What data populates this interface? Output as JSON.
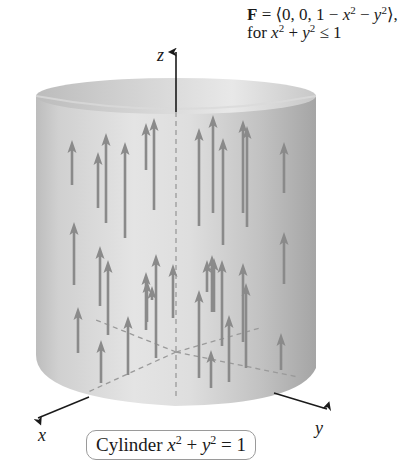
{
  "figure": {
    "title_line1": {
      "F": "F",
      "eq": " = ⟨0, 0, 1 − ",
      "x": "x",
      "x_exp": "2",
      "minus": " − ",
      "y": "y",
      "y_exp": "2",
      "close": "⟩,"
    },
    "title_line2": {
      "for": "for ",
      "x": "x",
      "x_exp": "2",
      "plus": " + ",
      "y": "y",
      "y_exp": "2",
      "rel": " ≤ 1"
    },
    "axes": {
      "z_label": "z",
      "x_label": "x",
      "y_label": "y"
    },
    "cylinder_label": {
      "word": "Cylinder ",
      "x": "x",
      "x_exp": "2",
      "plus": " + ",
      "y": "y",
      "y_exp": "2",
      "eq": " = 1"
    },
    "colors": {
      "cylinder_light": "#e2e2e2",
      "cylinder_mid": "#c9c9c9",
      "cylinder_dark": "#a8a8a8",
      "arrow": "#8a8a8a",
      "axis": "#1a1a1a",
      "dashed": "#9a9a9a"
    },
    "arrows": [
      {
        "x": 72,
        "y1": 185,
        "y2": 140
      },
      {
        "x": 98,
        "y1": 208,
        "y2": 152
      },
      {
        "x": 106,
        "y1": 223,
        "y2": 133
      },
      {
        "x": 125,
        "y1": 238,
        "y2": 142
      },
      {
        "x": 146,
        "y1": 170,
        "y2": 123
      },
      {
        "x": 154,
        "y1": 210,
        "y2": 118
      },
      {
        "x": 199,
        "y1": 226,
        "y2": 128
      },
      {
        "x": 213,
        "y1": 213,
        "y2": 115
      },
      {
        "x": 223,
        "y1": 245,
        "y2": 138
      },
      {
        "x": 243,
        "y1": 213,
        "y2": 120
      },
      {
        "x": 247,
        "y1": 227,
        "y2": 126
      },
      {
        "x": 284,
        "y1": 193,
        "y2": 142
      },
      {
        "x": 74,
        "y1": 285,
        "y2": 222
      },
      {
        "x": 100,
        "y1": 306,
        "y2": 246
      },
      {
        "x": 108,
        "y1": 335,
        "y2": 260
      },
      {
        "x": 146,
        "y1": 330,
        "y2": 272
      },
      {
        "x": 156,
        "y1": 358,
        "y2": 254
      },
      {
        "x": 147,
        "y1": 322,
        "y2": 280
      },
      {
        "x": 207,
        "y1": 292,
        "y2": 260
      },
      {
        "x": 214,
        "y1": 312,
        "y2": 258
      },
      {
        "x": 152,
        "y1": 300,
        "y2": 286
      },
      {
        "x": 173,
        "y1": 318,
        "y2": 264
      },
      {
        "x": 199,
        "y1": 378,
        "y2": 290
      },
      {
        "x": 212,
        "y1": 312,
        "y2": 255
      },
      {
        "x": 222,
        "y1": 346,
        "y2": 260
      },
      {
        "x": 243,
        "y1": 342,
        "y2": 263
      },
      {
        "x": 246,
        "y1": 368,
        "y2": 283
      },
      {
        "x": 284,
        "y1": 284,
        "y2": 232
      },
      {
        "x": 78,
        "y1": 353,
        "y2": 307
      },
      {
        "x": 101,
        "y1": 383,
        "y2": 340
      },
      {
        "x": 128,
        "y1": 375,
        "y2": 316
      },
      {
        "x": 211,
        "y1": 388,
        "y2": 350
      },
      {
        "x": 229,
        "y1": 382,
        "y2": 315
      },
      {
        "x": 281,
        "y1": 370,
        "y2": 333
      }
    ]
  }
}
